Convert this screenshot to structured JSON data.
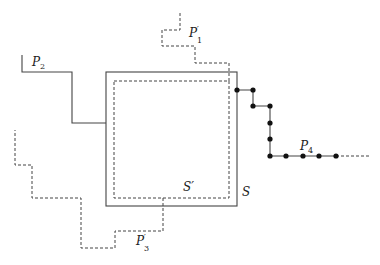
{
  "diagram": {
    "header_fragment": "— —— ——— ——— ——— ———",
    "labels": {
      "P2": {
        "base": "P",
        "sub": "2",
        "prime": ""
      },
      "P1prime": {
        "base": "P",
        "sub": "1",
        "prime": "′"
      },
      "P3prime": {
        "base": "P",
        "sub": "3",
        "prime": "′"
      },
      "P4": {
        "base": "P",
        "sub": "4",
        "prime": ""
      },
      "S": "S",
      "Sprime": "S′"
    },
    "colors": {
      "solid": "#444444",
      "dashed": "#444444",
      "dot": "#111111"
    },
    "shapes": {
      "S_square": {
        "x": 106,
        "y": 72,
        "w": 131,
        "h": 134,
        "style": "solid"
      },
      "Sprime_square": {
        "x": 114,
        "y": 81,
        "w": 115,
        "h": 117,
        "style": "dashed"
      },
      "P2_path": "22,55 22,72 72,72 72,123 106,123",
      "P1prime_path": "180,13 180,30 162,30 162,46 195,46 195,63 229,63 229,81",
      "P3prime_path": "163,198 163,231 115,231 115,248 81,248 81,198 32,198 32,165 15,165 15,130",
      "P4_path": "237,90 253,90 253,106 270,106 270,156 336,156",
      "P4_tail": "336,156 370,156",
      "P4_nodes": [
        [
          237,
          90
        ],
        [
          253,
          90
        ],
        [
          253,
          106
        ],
        [
          270,
          106
        ],
        [
          270,
          123
        ],
        [
          270,
          139
        ],
        [
          270,
          156
        ],
        [
          286,
          156
        ],
        [
          303,
          156
        ],
        [
          319,
          156
        ],
        [
          336,
          156
        ]
      ]
    }
  }
}
